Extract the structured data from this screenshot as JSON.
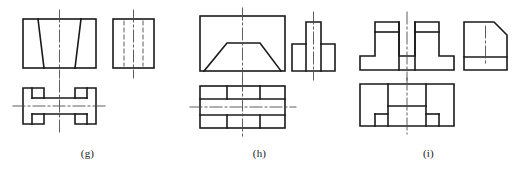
{
  "sheet": {
    "title": "Orthographic projection exercise figures",
    "background_color": "#ffffff",
    "line_color": "#1a1a1a",
    "center_line_color": "#4d4d4d",
    "hidden_line_color": "#6b6b6b"
  },
  "groups": [
    {
      "id": "g",
      "label": "(g)",
      "description": "Front view rectangle with inner trapezoid, side view rectangle with two hidden lines, top view H-shaped plate with notches",
      "views": [
        {
          "name": "front-view",
          "type": "rectangle-with-trapezoid",
          "outline": "rectangle",
          "features": "two slanted interior lines forming a trapezoid opening downward",
          "center_line": "vertical"
        },
        {
          "name": "side-view",
          "type": "rectangle-with-hidden-lines",
          "outline": "rectangle",
          "features": "two vertical hidden (dashed) lines",
          "center_line": "vertical"
        },
        {
          "name": "top-view",
          "type": "h-shaped-plate",
          "outline": "H shape with rectangular notches on left and right",
          "center_line": "horizontal and vertical"
        }
      ]
    },
    {
      "id": "h",
      "label": "(h)",
      "description": "Front view rectangle with trapezoid prism, side view T-shaped stepped block, top view banded rectangle",
      "views": [
        {
          "name": "front-view",
          "type": "rectangle-with-trapezoid",
          "outline": "rectangle",
          "features": "trapezoid resting on bottom edge with sloped left and right sides",
          "center_line": "vertical"
        },
        {
          "name": "side-view",
          "type": "t-shaped-block",
          "outline": "tall narrow center rib with lower flanges both sides",
          "center_line": "vertical"
        },
        {
          "name": "top-view",
          "type": "banded-rectangle",
          "outline": "rectangle divided into three horizontal bands with vertical dividers",
          "center_line": "horizontal and vertical"
        }
      ]
    },
    {
      "id": "i",
      "label": "(i)",
      "description": "Front view stepped base with two uprights, side view rectangle with chamfered corner, top view U-shaped block",
      "views": [
        {
          "name": "front-view",
          "type": "stepped-base-with-uprights",
          "outline": "wide base with two raised rectangular blocks",
          "center_line": "vertical"
        },
        {
          "name": "side-view",
          "type": "chamfered-rectangle",
          "outline": "rectangle with chamfer at top right corner and horizontal band near bottom",
          "center_line": "vertical hidden"
        },
        {
          "name": "top-view",
          "type": "u-shaped-block",
          "outline": "rectangle with central rectangular notch cut from top edge",
          "center_line": "vertical"
        }
      ]
    }
  ]
}
